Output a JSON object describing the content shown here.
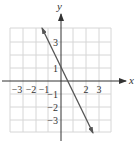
{
  "chart_data": {
    "type": "line",
    "title": "",
    "xlabel": "x",
    "ylabel": "y",
    "xlim": [
      -4,
      4
    ],
    "ylim": [
      -4,
      4
    ],
    "grid": true,
    "x_tick_labels": [
      "-3",
      "-2",
      "-1",
      "2",
      "3"
    ],
    "y_tick_labels": [
      "3",
      "1",
      "-1",
      "-2",
      "-3"
    ],
    "series": [
      {
        "name": "y = -2x + 1",
        "equation": "y = -2x + 1",
        "x": [
          -1.5,
          0,
          0.5,
          2.5
        ],
        "y": [
          4,
          1,
          0,
          -4
        ],
        "arrows": "both"
      }
    ]
  },
  "labels": {
    "x_axis": "x",
    "y_axis": "y",
    "xt_m3": "−3",
    "xt_m2": "−2",
    "xt_m1": "−1",
    "xt_2": "2",
    "xt_3": "3",
    "yt_3": "3",
    "yt_1": "1",
    "yt_m1": "−1",
    "yt_m2": "−2",
    "yt_m3": "−3"
  },
  "colors": {
    "grid": "#d6d6d6",
    "axis": "#333333",
    "line": "#555555"
  }
}
